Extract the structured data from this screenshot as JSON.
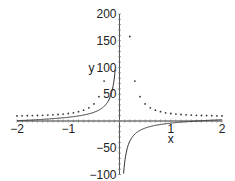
{
  "chart_data": {
    "type": "line",
    "title": "",
    "xlabel": "x",
    "ylabel": "y",
    "xlim": [
      -2,
      2
    ],
    "ylim": [
      -100,
      200
    ],
    "x_ticks": [
      "-2",
      "-1",
      "1",
      "2"
    ],
    "y_ticks": [
      "-100",
      "-50",
      "50",
      "100",
      "150",
      "200"
    ],
    "grid": false,
    "legend": null,
    "series": [
      {
        "name": "solid curve",
        "style": "solid",
        "x": [
          -2,
          -1.5,
          -1,
          -0.5,
          -0.25,
          -0.1,
          -0.08,
          0.08,
          0.1,
          0.25,
          0.5,
          1,
          1.5,
          2
        ],
        "y": [
          2,
          3,
          7,
          14,
          30,
          68,
          100,
          -100,
          -75,
          -28,
          -12,
          -5,
          -2,
          1
        ]
      },
      {
        "name": "dotted curve",
        "style": "dotted",
        "x": [
          -2,
          -1.5,
          -1,
          -0.75,
          -0.5,
          -0.4,
          -0.3,
          0.25,
          0.35,
          0.45,
          0.55,
          0.75,
          1,
          1.5,
          2
        ],
        "y": [
          10,
          11,
          14,
          19,
          32,
          45,
          75,
          100,
          56,
          38,
          28,
          19,
          14,
          11,
          10
        ]
      }
    ]
  },
  "axis_labels": {
    "x": "x",
    "y": "y"
  }
}
